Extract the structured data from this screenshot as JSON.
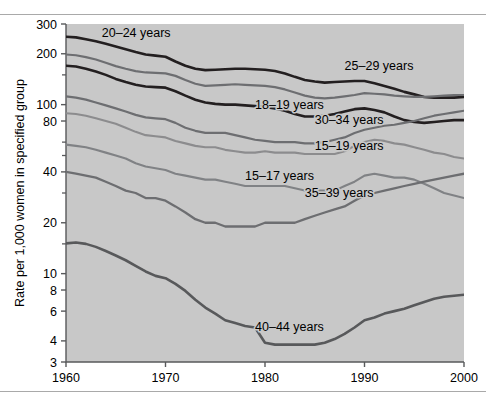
{
  "figure": {
    "plot_bg": "#c8c8c8",
    "axis_color": "#58595b"
  },
  "chart_data": {
    "type": "line",
    "title": "",
    "subtitle": "",
    "xlabel": "",
    "ylabel": "Rate per 1,000 women in specified group",
    "yscale": "log",
    "ylim": [
      3,
      300
    ],
    "xlim": [
      1960,
      2000
    ],
    "grid": false,
    "legend_position": "inline-labels",
    "ytick_labels": [
      "300",
      "200",
      "100",
      "80",
      "40",
      "20",
      "10",
      "8",
      "6",
      "4",
      "3"
    ],
    "ytick_values": [
      300,
      200,
      100,
      80,
      40,
      20,
      10,
      8,
      6,
      4,
      3
    ],
    "ytick_minor_values": [
      150,
      60,
      50,
      30,
      15
    ],
    "xtick_labels": [
      "1960",
      "1970",
      "1980",
      "1990",
      "2000"
    ],
    "xtick_values": [
      1960,
      1970,
      1980,
      1990,
      2000
    ],
    "x": [
      1960,
      1961,
      1962,
      1963,
      1964,
      1965,
      1966,
      1967,
      1968,
      1969,
      1970,
      1971,
      1972,
      1973,
      1974,
      1975,
      1976,
      1977,
      1978,
      1979,
      1980,
      1981,
      1982,
      1983,
      1984,
      1985,
      1986,
      1987,
      1988,
      1989,
      1990,
      1991,
      1992,
      1993,
      1994,
      1995,
      1996,
      1997,
      1998,
      1999,
      2000
    ],
    "series": [
      {
        "name": "20-24 years",
        "label": "20–24 years",
        "color": "#231f20",
        "width": 2.6,
        "label_x": 1963.6,
        "label_y_value": 252,
        "values": [
          252,
          250,
          244,
          237,
          229,
          221,
          213,
          205,
          198,
          195,
          192,
          180,
          170,
          163,
          160,
          161,
          162,
          163,
          163,
          162,
          161,
          158,
          153,
          146,
          140,
          137,
          135,
          136,
          137,
          138,
          138,
          134,
          129,
          124,
          119,
          115,
          111,
          110,
          110,
          110,
          111
        ]
      },
      {
        "name": "25-29 years",
        "label": "25–29 years",
        "color": "#6d6e71",
        "width": 2.2,
        "label_x": 1988.0,
        "label_y_value": 160,
        "values": [
          198,
          196,
          191,
          185,
          177,
          169,
          163,
          158,
          155,
          154,
          153,
          148,
          140,
          133,
          129,
          130,
          131,
          132,
          131,
          130,
          129,
          127,
          123,
          118,
          113,
          110,
          109,
          110,
          112,
          114,
          117,
          116,
          115,
          113,
          112,
          111,
          111,
          112,
          113,
          114,
          114
        ]
      },
      {
        "name": "18-19 years",
        "label": "18–19 years",
        "color": "#231f20",
        "width": 2.6,
        "label_x": 1979.0,
        "label_y_value": 94,
        "values": [
          170,
          168,
          163,
          157,
          150,
          142,
          136,
          131,
          128,
          127,
          126,
          120,
          113,
          107,
          103,
          101,
          100,
          100,
          99,
          98,
          97,
          95,
          92,
          88,
          85,
          85,
          86,
          88,
          91,
          94,
          95,
          93,
          90,
          85,
          81,
          79,
          78,
          79,
          80,
          81,
          81
        ]
      },
      {
        "name": "30-34 years",
        "label": "30–34 years",
        "color": "#6d6e71",
        "width": 2.2,
        "label_x": 1985.0,
        "label_y_value": 77,
        "values": [
          112,
          110,
          107,
          103,
          99,
          95,
          91,
          87,
          84,
          83,
          82,
          78,
          73,
          70,
          68,
          68,
          68,
          66,
          64,
          62,
          61,
          60,
          60,
          60,
          59,
          59,
          60,
          62,
          64,
          68,
          71,
          73,
          75,
          76,
          78,
          80,
          83,
          86,
          88,
          90,
          92
        ]
      },
      {
        "name": "15-19 years",
        "label": "15–19 years",
        "color": "#8c8c8e",
        "width": 2.1,
        "label_x": 1985.0,
        "label_y_value": 54,
        "values": [
          89,
          88,
          86,
          83,
          80,
          77,
          73,
          69,
          66,
          65,
          64,
          61,
          59,
          57,
          56,
          56,
          54,
          53,
          52,
          52,
          53,
          52,
          52,
          52,
          51,
          51,
          51,
          51,
          53,
          57,
          60,
          62,
          61,
          59,
          58,
          56,
          54,
          52,
          51,
          49,
          48
        ]
      },
      {
        "name": "15-17 years",
        "label": "15–17 years",
        "color": "#808285",
        "width": 2.1,
        "label_x": 1978.0,
        "label_y_value": 36,
        "values": [
          58,
          57,
          56,
          54,
          52,
          50,
          48,
          45,
          43,
          42,
          41,
          39,
          38,
          37,
          36,
          36,
          35,
          34,
          33,
          33,
          33,
          33,
          33,
          32,
          31,
          31,
          31,
          31,
          33,
          35,
          38,
          39,
          38,
          37,
          37,
          36,
          34,
          32,
          30,
          29,
          28
        ]
      },
      {
        "name": "35-39 years",
        "label": "35–39 years",
        "color": "#6d6e71",
        "width": 2.3,
        "label_x": 1984.0,
        "label_y_value": 28.5,
        "values": [
          40,
          39,
          38,
          37,
          35,
          33,
          31,
          30,
          28,
          28,
          27,
          25,
          23,
          21,
          20,
          20,
          19,
          19,
          19,
          19,
          20,
          20,
          20,
          20,
          21,
          22,
          23,
          24,
          25,
          27,
          29,
          30,
          31,
          32,
          33,
          34,
          35,
          36,
          37,
          38,
          39
        ]
      },
      {
        "name": "40-44 years",
        "label": "40–44 years",
        "color": "#58595b",
        "width": 2.6,
        "label_x": 1979.0,
        "label_y_value": 4.55,
        "values": [
          15.1,
          15.3,
          15.0,
          14.4,
          13.6,
          12.8,
          12.0,
          11.1,
          10.3,
          9.7,
          9.4,
          8.7,
          7.9,
          7.0,
          6.3,
          5.8,
          5.3,
          5.1,
          4.9,
          4.8,
          3.9,
          3.8,
          3.8,
          3.8,
          3.8,
          3.8,
          3.9,
          4.1,
          4.4,
          4.8,
          5.3,
          5.5,
          5.8,
          6.0,
          6.2,
          6.5,
          6.8,
          7.1,
          7.3,
          7.4,
          7.5
        ]
      }
    ]
  }
}
